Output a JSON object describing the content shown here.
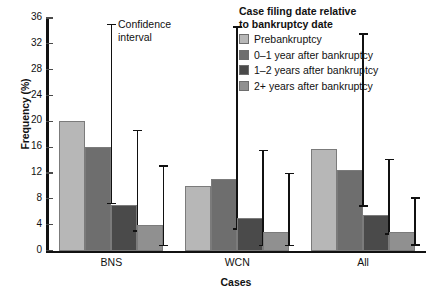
{
  "chart_data": {
    "type": "bar",
    "title": "",
    "xlabel": "Cases",
    "ylabel": "Frequency (%)",
    "ylim": [
      0,
      36
    ],
    "ytick_step": 4,
    "yticks": [
      36,
      32,
      28,
      24,
      20,
      16,
      12,
      8,
      4,
      0
    ],
    "categories": [
      "BNS",
      "WCN",
      "All"
    ],
    "grid": false,
    "legend_position": "top-right",
    "legend_title": "Case filing date relative\nto bankruptcy date",
    "annotation": "Confidence\ninterval",
    "series": [
      {
        "name": "Prebankruptcy",
        "color": "#b7b7b7",
        "values": [
          20.0,
          10.0,
          15.7
        ],
        "ci_low": [
          null,
          null,
          null
        ],
        "ci_high": [
          null,
          null,
          null
        ]
      },
      {
        "name": "0–1 year after bankruptcy",
        "color": "#6e6e6e",
        "values": [
          16.0,
          11.0,
          12.5
        ],
        "ci_low": [
          7.3,
          3.3,
          6.9
        ],
        "ci_high": [
          35.0,
          34.6,
          33.5
        ]
      },
      {
        "name": "1–2 years after bankruptcy",
        "color": "#4a4a4a",
        "values": [
          7.0,
          5.0,
          5.5
        ],
        "ci_low": [
          3.0,
          0.8,
          2.6
        ],
        "ci_high": [
          18.6,
          15.5,
          14.1
        ]
      },
      {
        "name": "2+ years after bankruptcy",
        "color": "#909090",
        "values": [
          4.0,
          2.9,
          2.8
        ],
        "ci_low": [
          0.8,
          0.8,
          0.9
        ],
        "ci_high": [
          13.1,
          11.9,
          8.1
        ]
      }
    ]
  },
  "legend": {
    "title": "Case filing date relative\nto bankruptcy date",
    "items": [
      {
        "label": "Prebankruptcy",
        "color": "#b7b7b7"
      },
      {
        "label": "0–1 year after bankruptcy",
        "color": "#6e6e6e"
      },
      {
        "label": "1–2 years after bankruptcy",
        "color": "#4a4a4a"
      },
      {
        "label": "2+ years after bankruptcy",
        "color": "#909090"
      }
    ]
  },
  "annotation": {
    "text": "Confidence\ninterval"
  },
  "axes": {
    "ylabel": "Frequency (%)",
    "xlabel": "Cases"
  }
}
